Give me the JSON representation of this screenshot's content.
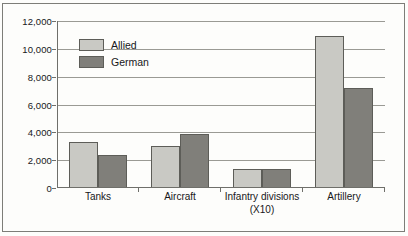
{
  "chart_data": {
    "type": "bar",
    "title": "",
    "xlabel": "",
    "ylabel": "",
    "ylim": [
      0,
      12000
    ],
    "yticks": [
      0,
      2000,
      4000,
      6000,
      8000,
      10000,
      12000
    ],
    "ytick_labels": [
      "0",
      "2,000",
      "4,000",
      "6,000",
      "8,000",
      "10,000",
      "12,000"
    ],
    "grid": true,
    "legend_position": "upper-left-inside",
    "categories": [
      "Tanks",
      "Aircraft",
      "Infantry divisions (X10)",
      "Artillery"
    ],
    "category_labels": [
      {
        "line1": "Tanks",
        "line2": ""
      },
      {
        "line1": "Aircraft",
        "line2": ""
      },
      {
        "line1": "Infantry divisions",
        "line2": "(X10)"
      },
      {
        "line1": "Artillery",
        "line2": ""
      }
    ],
    "series": [
      {
        "name": "Allied",
        "color": "#c9c9c4",
        "values": [
          3300,
          3000,
          1350,
          10900
        ]
      },
      {
        "name": "German",
        "color": "#807f7a",
        "values": [
          2400,
          3900,
          1350,
          7200
        ]
      }
    ]
  },
  "style": {
    "bar_border_color": "#5d5d58",
    "grid_color": "#9a9a94",
    "axis_color": "#6f6f6a",
    "frame_color": "#7d7d78",
    "text_color": "#17171a",
    "background": "#fdfdfb"
  }
}
